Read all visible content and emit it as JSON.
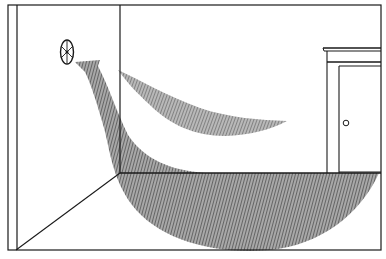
{
  "figure": {
    "colors": {
      "background": "#ffffff",
      "line": "#1a1a1a",
      "airflow_hatch": "#8a8a8a",
      "airflow_hatch_dark": "#555555"
    },
    "elements": {
      "fan": "wall-fan-icon",
      "upper_airflow": "upper-airflow-plume",
      "lower_airflow": "lower-airflow-plume",
      "door": "door",
      "door_knob": "door-knob-icon"
    }
  }
}
